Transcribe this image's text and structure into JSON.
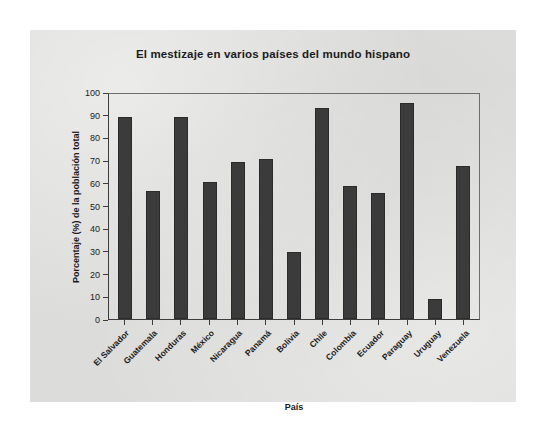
{
  "chart_data": {
    "type": "bar",
    "title": "El mestizaje en varios países del mundo hispano",
    "xlabel": "País",
    "ylabel": "Porcentaje (%) de la población total",
    "categories": [
      "El Salvador",
      "Guatemala",
      "Honduras",
      "México",
      "Nicaragua",
      "Panamá",
      "Bolivia",
      "Chile",
      "Colombia",
      "Ecuador",
      "Paraguay",
      "Uruguay",
      "Venezuela"
    ],
    "values": [
      90,
      57,
      90,
      61,
      70,
      71,
      30,
      94,
      59,
      56,
      96,
      9,
      68
    ],
    "ylim": [
      0,
      100
    ],
    "yticks": [
      100,
      90,
      80,
      70,
      60,
      50,
      40,
      30,
      20,
      10,
      0
    ],
    "grid": false,
    "legend": false,
    "bar_color": "#3b3b3b",
    "background_color": "#dcdcda",
    "axis_color": "#3d3d3d",
    "text_color": "#1b1b1b"
  }
}
